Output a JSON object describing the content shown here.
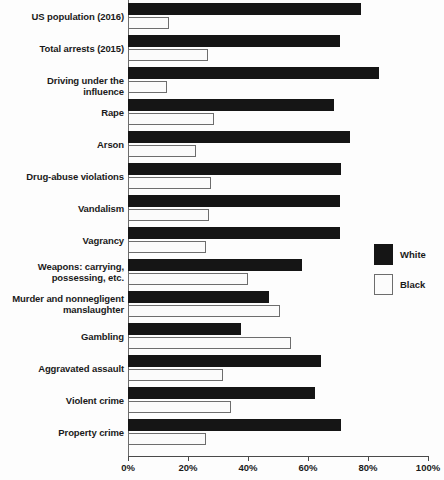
{
  "chart_data": {
    "type": "bar",
    "orientation": "horizontal",
    "title": "",
    "subtitle": "",
    "xlabel": "",
    "ylabel": "",
    "xlim": [
      0,
      100
    ],
    "xticks": [
      "0%",
      "20%",
      "40%",
      "60%",
      "80%",
      "100%"
    ],
    "xtick_values": [
      0,
      20,
      40,
      60,
      80,
      100
    ],
    "grid": false,
    "legend_position": "right",
    "categories": [
      "US population (2016)",
      "Total arrests (2015)",
      "Driving under the influence",
      "Rape",
      "Arson",
      "Drug-abuse violations",
      "Vandalism",
      "Vagrancy",
      "Weapons: carrying, possessing, etc.",
      "Murder and nonnegligent manslaughter",
      "Gambling",
      "Aggravated assault",
      "Violent crime",
      "Property crime"
    ],
    "category_lines": [
      [
        "US population (2016)"
      ],
      [
        "Total arrests (2015)"
      ],
      [
        "Driving under the influence"
      ],
      [
        "Rape"
      ],
      [
        "Arson"
      ],
      [
        "Drug-abuse violations"
      ],
      [
        "Vandalism"
      ],
      [
        "Vagrancy"
      ],
      [
        "Weapons: carrying,",
        "possessing, etc."
      ],
      [
        "Murder and nonnegligent",
        "manslaughter"
      ],
      [
        "Gambling"
      ],
      [
        "Aggravated assault"
      ],
      [
        "Violent crime"
      ],
      [
        "Property crime"
      ]
    ],
    "series": [
      {
        "name": "White",
        "color": "#151515",
        "values": [
          77.7,
          70.7,
          83.7,
          68.7,
          74.0,
          71.0,
          70.7,
          70.7,
          58.0,
          47.0,
          37.7,
          64.3,
          62.3,
          71.0
        ]
      },
      {
        "name": "Black",
        "color": "#ffffff",
        "values": [
          13.5,
          26.7,
          13.0,
          28.7,
          22.7,
          27.7,
          27.0,
          26.0,
          40.0,
          50.7,
          54.3,
          31.7,
          34.3,
          26.0
        ]
      }
    ]
  },
  "legend": {
    "items": [
      {
        "label": "White"
      },
      {
        "label": "Black"
      }
    ]
  }
}
